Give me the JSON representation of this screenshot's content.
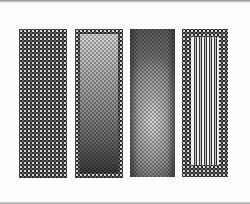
{
  "figure": {
    "panels": [
      {
        "id": 1,
        "pattern": "dark dotted halftone",
        "colors": {
          "base": "#2b2b2b",
          "dots": "#ebebeb"
        }
      },
      {
        "id": 2,
        "pattern": "dotted border with vertical light-to-dark gradient",
        "colors": {
          "top": "#d6d6d6",
          "bottom": "#3a3a3a"
        }
      },
      {
        "id": 3,
        "pattern": "checkered grey gradient, lighter center-bottom",
        "colors": {
          "light": "#d8d8d8",
          "dark": "#5a5a5a"
        }
      },
      {
        "id": 4,
        "pattern": "dotted border with vertical stripes",
        "colors": {
          "light": "#f2f2f2",
          "dark": "#2a2a2a"
        }
      }
    ]
  }
}
